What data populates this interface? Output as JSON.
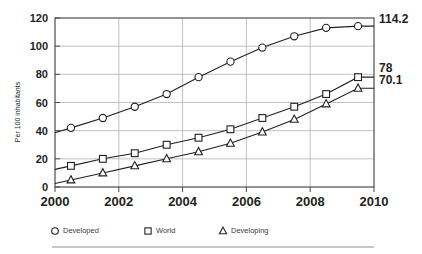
{
  "chart_data": {
    "type": "line",
    "title": "",
    "subtitle": "",
    "xlabel": "",
    "ylabel": "Per 100 inhabitants",
    "xlim": [
      2000,
      2010
    ],
    "ylim": [
      0,
      120
    ],
    "xticks": [
      "2000",
      "2002",
      "2004",
      "2006",
      "2008",
      "2010"
    ],
    "xtick_values": [
      2000,
      2002,
      2004,
      2006,
      2008,
      2010
    ],
    "yticks": [
      "0",
      "20",
      "40",
      "60",
      "80",
      "100",
      "120"
    ],
    "ytick_values": [
      0,
      20,
      40,
      60,
      80,
      100,
      120
    ],
    "grid": true,
    "grid_axis": "both",
    "legend_position": "bottom",
    "x": [
      2000.5,
      2001.5,
      2002.5,
      2003.5,
      2004.5,
      2005.5,
      2006.5,
      2007.5,
      2008.5,
      2009.5
    ],
    "series": [
      {
        "name": "Developed",
        "marker": "circle",
        "values": [
          42,
          49,
          57,
          66,
          78,
          89,
          99,
          107,
          113,
          114.2
        ],
        "end_label": "114.2"
      },
      {
        "name": "World",
        "marker": "square",
        "values": [
          15,
          20,
          24,
          30,
          35,
          41,
          49,
          57,
          66,
          78
        ],
        "end_label": "78"
      },
      {
        "name": "Developing",
        "marker": "triangle",
        "values": [
          5,
          10,
          15,
          20,
          25,
          31,
          39,
          48,
          59,
          70.1
        ],
        "end_label": "70.1"
      }
    ],
    "annotations": [
      {
        "text": "114.2",
        "series": "Developed"
      },
      {
        "text": "78",
        "series": "World"
      },
      {
        "text": "70.1",
        "series": "Developing"
      }
    ]
  },
  "legend": {
    "items": [
      {
        "label": "Developed",
        "marker": "circle"
      },
      {
        "label": "World",
        "marker": "square"
      },
      {
        "label": "Developing",
        "marker": "triangle"
      }
    ]
  },
  "colors": {
    "line": "#231f20",
    "grid": "#b9b9b9",
    "frame": "#5a5a5a",
    "text": "#231f20",
    "legend_text": "#3b3b3b",
    "marker_fill": "#ffffff",
    "divider": "#8d8d8d",
    "background": "#ffffff"
  }
}
